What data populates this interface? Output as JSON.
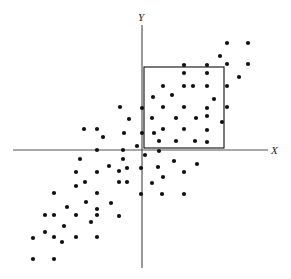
{
  "chart_data": {
    "type": "scatter",
    "title": "",
    "xlabel": "X",
    "ylabel": "Y",
    "grid": false,
    "legend": null,
    "axes_pixel": {
      "origin": [
        142,
        150
      ],
      "x_axis": {
        "from": 13,
        "to": 268,
        "y": 150
      },
      "y_axis": {
        "from": 25,
        "to": 268,
        "x": 142
      }
    },
    "annotations": [
      {
        "type": "rectangle",
        "label": "selected-region",
        "x0": 144,
        "y0": 67,
        "x1": 224,
        "y1": 148
      }
    ],
    "points_pixel": [
      [
        227,
        43
      ],
      [
        248,
        43
      ],
      [
        220,
        56
      ],
      [
        227,
        64
      ],
      [
        248,
        64
      ],
      [
        239,
        77
      ],
      [
        184,
        65
      ],
      [
        207,
        65
      ],
      [
        184,
        73
      ],
      [
        207,
        73
      ],
      [
        163,
        86
      ],
      [
        184,
        86
      ],
      [
        193,
        86
      ],
      [
        207,
        86
      ],
      [
        227,
        86
      ],
      [
        153,
        97
      ],
      [
        172,
        95
      ],
      [
        214,
        99
      ],
      [
        142,
        108
      ],
      [
        163,
        107
      ],
      [
        184,
        107
      ],
      [
        207,
        108
      ],
      [
        227,
        107
      ],
      [
        152,
        118
      ],
      [
        176,
        118
      ],
      [
        196,
        118
      ],
      [
        207,
        116
      ],
      [
        222,
        122
      ],
      [
        154,
        133
      ],
      [
        163,
        129
      ],
      [
        184,
        129
      ],
      [
        207,
        130
      ],
      [
        142,
        133
      ],
      [
        159,
        141
      ],
      [
        176,
        141
      ],
      [
        195,
        141
      ],
      [
        207,
        142
      ],
      [
        145,
        155
      ],
      [
        159,
        151
      ],
      [
        141,
        168
      ],
      [
        158,
        167
      ],
      [
        174,
        161
      ],
      [
        197,
        164
      ],
      [
        184,
        172
      ],
      [
        152,
        183
      ],
      [
        163,
        177
      ],
      [
        141,
        194
      ],
      [
        162,
        194
      ],
      [
        184,
        194
      ],
      [
        120,
        107
      ],
      [
        129,
        119
      ],
      [
        84,
        129
      ],
      [
        97,
        129
      ],
      [
        103,
        137
      ],
      [
        124,
        133
      ],
      [
        137,
        146
      ],
      [
        97,
        150
      ],
      [
        123,
        150
      ],
      [
        80,
        159
      ],
      [
        123,
        159
      ],
      [
        109,
        166
      ],
      [
        119,
        171
      ],
      [
        76,
        172
      ],
      [
        97,
        172
      ],
      [
        127,
        168
      ],
      [
        54,
        193
      ],
      [
        76,
        186
      ],
      [
        85,
        182
      ],
      [
        97,
        193
      ],
      [
        119,
        182
      ],
      [
        127,
        182
      ],
      [
        67,
        207
      ],
      [
        86,
        202
      ],
      [
        111,
        203
      ],
      [
        97,
        209
      ],
      [
        119,
        216
      ],
      [
        45,
        215
      ],
      [
        54,
        215
      ],
      [
        76,
        215
      ],
      [
        97,
        215
      ],
      [
        64,
        226
      ],
      [
        91,
        222
      ],
      [
        33,
        238
      ],
      [
        45,
        232
      ],
      [
        54,
        237
      ],
      [
        62,
        242
      ],
      [
        76,
        237
      ],
      [
        97,
        237
      ],
      [
        33,
        259
      ],
      [
        54,
        259
      ]
    ]
  },
  "labels": {
    "x_axis": "X",
    "y_axis": "Y"
  },
  "colors": {
    "dot": "#111111",
    "axis": "#555555",
    "box": "#222222",
    "background": "#ffffff"
  }
}
